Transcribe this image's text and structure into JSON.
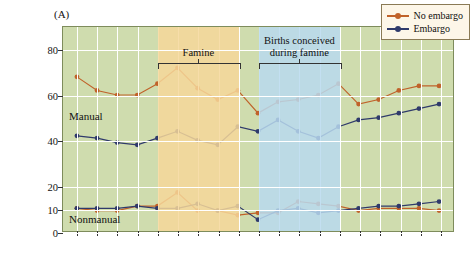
{
  "panel": {
    "label": "(A)"
  },
  "axis": {
    "y_title_line1": "Mild mental retardation",
    "y_title_line2": "(rate/1000)",
    "y_ticks": [
      "80",
      "60",
      "40",
      "20",
      "10",
      "0"
    ],
    "y_min": 0,
    "y_max": 90
  },
  "annotations": {
    "famine": "Famine",
    "births": "Births conceived",
    "births2": "during famine",
    "manual": "Manual",
    "nonmanual": "Nonmanual"
  },
  "legend": {
    "items": [
      {
        "label": "No embargo",
        "color": "#c0622a"
      },
      {
        "label": "Embargo",
        "color": "#2f3a6b"
      }
    ]
  },
  "colors": {
    "plot_background": "#cfdcae",
    "famine_band": "#f6d79a",
    "births_band": "#b9d9ee",
    "no_embargo": "#c0622a",
    "embargo": "#2f3a6b",
    "grid": "#ffffff"
  },
  "chart_data": {
    "type": "line",
    "xlabel": "",
    "ylabel": "Mild mental retardation (rate/1000)",
    "ylim": [
      0,
      90
    ],
    "ytick_labels": [
      "0",
      "10",
      "20",
      "40",
      "60",
      "80"
    ],
    "ytick_values": [
      0,
      10,
      20,
      40,
      60,
      80
    ],
    "grid": true,
    "legend_position": "top-right",
    "bands": [
      {
        "name": "Famine",
        "x_start": 5.0,
        "x_end": 9.0,
        "color": "#f6d79a"
      },
      {
        "name": "Births conceived during famine",
        "x_start": 10.0,
        "x_end": 14.0,
        "color": "#b9d9ee"
      }
    ],
    "x": [
      1,
      2,
      3,
      4,
      5,
      6,
      7,
      8,
      9,
      10,
      11,
      12,
      13,
      14,
      15,
      16,
      17,
      18,
      19
    ],
    "series": [
      {
        "name": "No embargo",
        "group": "Manual",
        "color": "#c0622a",
        "values": [
          68,
          62,
          60,
          60,
          65,
          72,
          63,
          58,
          62,
          52,
          57,
          58,
          60,
          65,
          56,
          58,
          62,
          64,
          64
        ]
      },
      {
        "name": "Embargo",
        "group": "Manual",
        "color": "#2f3a6b",
        "values": [
          42,
          41,
          39,
          38,
          41,
          44,
          40,
          38,
          46,
          44,
          49,
          44,
          41,
          46,
          49,
          50,
          52,
          54,
          56
        ]
      },
      {
        "name": "No embargo",
        "group": "Nonmanual",
        "color": "#c0622a",
        "values": [
          10,
          9,
          9,
          11,
          11,
          17,
          9,
          9,
          7,
          8,
          8,
          13,
          12,
          11,
          9,
          10,
          10,
          10,
          9
        ]
      },
      {
        "name": "Embargo",
        "group": "Nonmanual",
        "color": "#2f3a6b",
        "values": [
          10,
          10,
          10,
          11,
          10,
          10,
          12,
          9,
          11,
          5,
          9,
          10,
          8,
          9,
          10,
          11,
          11,
          12,
          13
        ]
      }
    ]
  }
}
